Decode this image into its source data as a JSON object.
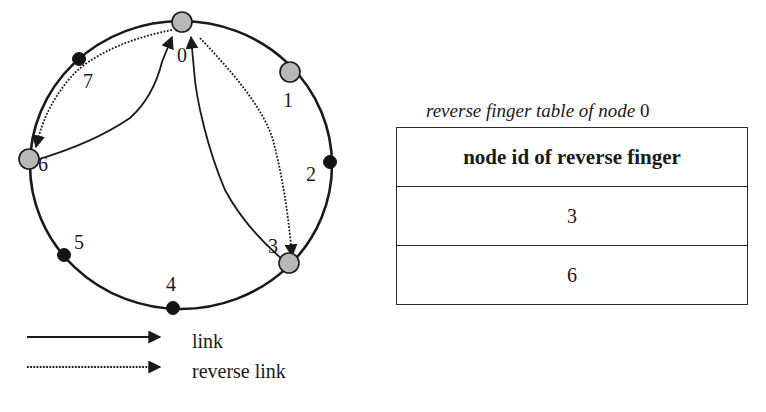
{
  "diagram": {
    "type": "chord-ring",
    "ring": {
      "center": [
        181,
        165
      ],
      "rx": 151,
      "ry": 144,
      "stroke": "#1a1a1a"
    },
    "colors": {
      "active_node": "#b8b8b8",
      "inactive_node": "#141414",
      "line": "#1a1a1a"
    },
    "nodes": [
      {
        "id": "0",
        "active": true,
        "x": 182,
        "y": 22,
        "label_x": 177,
        "label_y": 62
      },
      {
        "id": "1",
        "active": true,
        "x": 290,
        "y": 72,
        "label_x": 283,
        "label_y": 107
      },
      {
        "id": "2",
        "active": false,
        "x": 330,
        "y": 162,
        "label_x": 306,
        "label_y": 181
      },
      {
        "id": "3",
        "active": true,
        "x": 289,
        "y": 263,
        "label_x": 268,
        "label_y": 253
      },
      {
        "id": "4",
        "active": false,
        "x": 173,
        "y": 308,
        "label_x": 166,
        "label_y": 291
      },
      {
        "id": "5",
        "active": false,
        "x": 64,
        "y": 255,
        "label_x": 74,
        "label_y": 249
      },
      {
        "id": "6",
        "active": true,
        "x": 29,
        "y": 159,
        "label_x": 38,
        "label_y": 171
      },
      {
        "id": "7",
        "active": false,
        "x": 79,
        "y": 59,
        "label_x": 83,
        "label_y": 88
      }
    ],
    "edges": [
      {
        "from": "6",
        "to": "0",
        "kind": "link"
      },
      {
        "from": "3",
        "to": "0",
        "kind": "link"
      },
      {
        "from": "0",
        "to": "6",
        "kind": "reverse link"
      },
      {
        "from": "0",
        "to": "3",
        "kind": "reverse link"
      }
    ]
  },
  "legend": {
    "items": [
      {
        "style": "solid",
        "label": "link"
      },
      {
        "style": "dotted",
        "label": "reverse link"
      }
    ]
  },
  "table": {
    "caption_prefix": "reverse finger table of node",
    "caption_node": "0",
    "header": "node id of reverse finger",
    "rows": [
      "3",
      "6"
    ]
  }
}
